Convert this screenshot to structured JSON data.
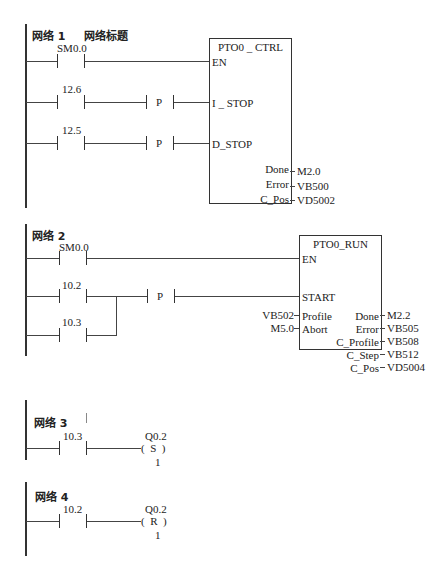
{
  "networks": [
    {
      "title": "网络 1",
      "comment": "网络标题",
      "contacts": [
        {
          "addr": "SM0.0"
        },
        {
          "addr": "12.6",
          "edge": "P"
        },
        {
          "addr": "12.5",
          "edge": "P"
        }
      ],
      "block": {
        "name": "PTO0 _ CTRL",
        "inputs": [
          "EN",
          "I _ STOP",
          "D_STOP"
        ],
        "outputs": [
          {
            "pin": "Done",
            "value": "M2.0"
          },
          {
            "pin": "Error",
            "value": "VB500"
          },
          {
            "pin": "C_Pos",
            "value": "VD5002"
          }
        ]
      }
    },
    {
      "title": "网络 2",
      "contacts": [
        {
          "addr": "SM0.0"
        },
        {
          "addr": "10.2",
          "edge": "P"
        },
        {
          "addr": "10.3"
        }
      ],
      "block": {
        "name": "PTO0_RUN",
        "inputs": [
          "EN",
          "START"
        ],
        "param_inputs": [
          {
            "pin": "Profile",
            "value": "VB502"
          },
          {
            "pin": "Abort",
            "value": "M5.0"
          }
        ],
        "outputs": [
          {
            "pin": "Done",
            "value": "M2.2"
          },
          {
            "pin": "Error",
            "value": "VB505"
          },
          {
            "pin": "C_Profile",
            "value": "VB508"
          },
          {
            "pin": "C_Step",
            "value": "VB512"
          },
          {
            "pin": "C_Pos",
            "value": "VD5004"
          }
        ]
      }
    },
    {
      "title": "网络 3",
      "contacts": [
        {
          "addr": "10.3"
        }
      ],
      "coil": {
        "addr": "Q0.2",
        "type": "S",
        "count": "1"
      }
    },
    {
      "title": "网络 4",
      "contacts": [
        {
          "addr": "10.2"
        }
      ],
      "coil": {
        "addr": "Q0.2",
        "type": "R",
        "count": "1"
      }
    }
  ]
}
